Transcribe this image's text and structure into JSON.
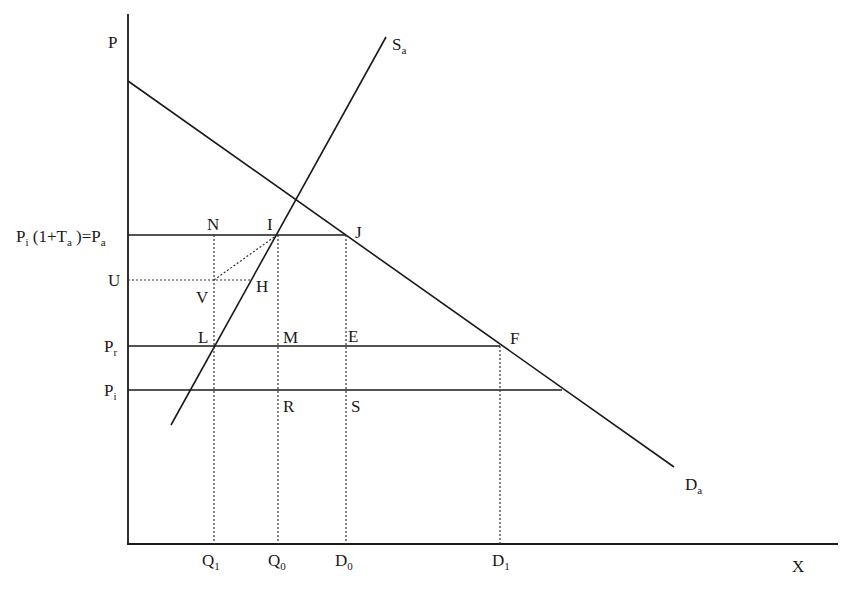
{
  "diagram": {
    "type": "supply-demand tariff diagram",
    "colors": {
      "line": "#1a1a1a",
      "background": "#ffffff"
    },
    "axes": {
      "y_label": "P",
      "x_label": "X"
    },
    "curves": {
      "supply": {
        "label": "S",
        "subscript": "a"
      },
      "demand": {
        "label": "D",
        "subscript": "a"
      }
    },
    "price_levels": {
      "pa": {
        "text_main": "P",
        "text_sub": "i",
        "text_rest": " (1+T",
        "text_sub2": "a",
        "text_close": " )=P",
        "text_sub3": "a"
      },
      "u": {
        "text": "U"
      },
      "pr": {
        "text_main": "P",
        "text_sub": "r"
      },
      "pi": {
        "text_main": "P",
        "text_sub": "i"
      }
    },
    "quantity_ticks": [
      {
        "main": "Q",
        "sub": "1"
      },
      {
        "main": "Q",
        "sub": "0"
      },
      {
        "main": "D",
        "sub": "0"
      },
      {
        "main": "D",
        "sub": "1"
      }
    ],
    "points": {
      "N": "N",
      "I": "I",
      "J": "J",
      "V": "V",
      "H": "H",
      "L": "L",
      "M": "M",
      "E": "E",
      "F": "F",
      "R": "R",
      "S": "S"
    }
  }
}
